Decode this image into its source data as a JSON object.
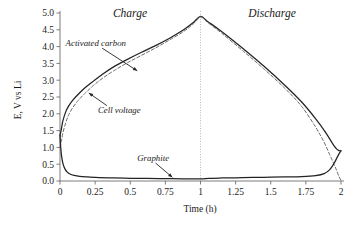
{
  "chart_data": {
    "type": "line",
    "title": "",
    "xlabel": "Time (h)",
    "ylabel": "E, V vs Li",
    "xlim": [
      0,
      2
    ],
    "ylim": [
      0.0,
      5.0
    ],
    "xticks": [
      "0",
      "0.25",
      "0.5",
      "0.75",
      "1",
      "1.25",
      "1.5",
      "1.75",
      "2"
    ],
    "xtick_values": [
      0,
      0.25,
      0.5,
      0.75,
      1,
      1.25,
      1.5,
      1.75,
      2
    ],
    "yticks": [
      "0.0",
      "0.5",
      "1.0",
      "1.5",
      "2.0",
      "2.5",
      "3.0",
      "3.5",
      "4.0",
      "4.5",
      "5.0"
    ],
    "ytick_values": [
      0.0,
      0.5,
      1.0,
      1.5,
      2.0,
      2.5,
      3.0,
      3.5,
      4.0,
      4.5,
      5.0
    ],
    "grid": false,
    "legend": "annotations",
    "regions": [
      {
        "name": "Charge",
        "label": "Charge",
        "x_start": 0,
        "x_end": 1
      },
      {
        "name": "Discharge",
        "label": "Discharge",
        "x_start": 1,
        "x_end": 2
      }
    ],
    "divider_x": 1,
    "series": [
      {
        "name": "Activated carbon",
        "style": "solid",
        "color": "#232323",
        "annotation": "Activated carbon",
        "x": [
          0.0,
          0.01,
          0.02,
          0.04,
          0.06,
          0.09,
          0.13,
          0.18,
          0.24,
          0.31,
          0.39,
          0.48,
          0.58,
          0.68,
          0.78,
          0.88,
          0.95,
          1.0,
          1.05,
          1.15,
          1.3,
          1.45,
          1.6,
          1.72,
          1.82,
          1.89,
          1.93,
          1.955,
          1.97,
          1.98,
          1.99,
          2.0
        ],
        "y": [
          1.35,
          1.55,
          1.78,
          2.05,
          2.22,
          2.4,
          2.58,
          2.78,
          2.98,
          3.2,
          3.42,
          3.62,
          3.83,
          4.03,
          4.25,
          4.5,
          4.72,
          4.9,
          4.75,
          4.45,
          3.95,
          3.42,
          2.85,
          2.35,
          1.85,
          1.45,
          1.18,
          1.02,
          0.95,
          0.92,
          0.9,
          0.9
        ]
      },
      {
        "name": "Cell voltage",
        "style": "dashed",
        "color": "#6a6a6a",
        "annotation": "Cell voltage",
        "x": [
          0.0,
          0.01,
          0.02,
          0.04,
          0.06,
          0.09,
          0.13,
          0.18,
          0.24,
          0.31,
          0.39,
          0.48,
          0.58,
          0.68,
          0.78,
          0.88,
          0.95,
          1.0,
          1.05,
          1.15,
          1.3,
          1.45,
          1.6,
          1.72,
          1.82,
          1.88,
          1.92,
          1.95,
          1.97,
          1.985,
          2.0
        ],
        "y": [
          1.0,
          1.18,
          1.42,
          1.72,
          1.95,
          2.18,
          2.4,
          2.62,
          2.85,
          3.08,
          3.3,
          3.52,
          3.74,
          3.96,
          4.2,
          4.45,
          4.68,
          4.88,
          4.72,
          4.4,
          3.88,
          3.34,
          2.76,
          2.22,
          1.6,
          1.15,
          0.78,
          0.5,
          0.3,
          0.14,
          0.02
        ]
      },
      {
        "name": "Graphite",
        "style": "solid",
        "color": "#232323",
        "annotation": "Graphite",
        "x": [
          0.0,
          0.005,
          0.012,
          0.022,
          0.035,
          0.05,
          0.07,
          0.1,
          0.14,
          0.2,
          0.28,
          0.38,
          0.5,
          0.62,
          0.75,
          0.88,
          1.0,
          1.06,
          1.15,
          1.3,
          1.45,
          1.6,
          1.72,
          1.82,
          1.88,
          1.92,
          1.95,
          1.97,
          1.985,
          2.0
        ],
        "y": [
          1.35,
          1.0,
          0.72,
          0.5,
          0.36,
          0.27,
          0.21,
          0.17,
          0.14,
          0.12,
          0.1,
          0.09,
          0.08,
          0.075,
          0.07,
          0.065,
          0.06,
          0.08,
          0.09,
          0.1,
          0.11,
          0.12,
          0.13,
          0.16,
          0.22,
          0.34,
          0.52,
          0.68,
          0.8,
          0.9
        ]
      }
    ],
    "annotations": [
      {
        "name": "activated-carbon",
        "text": "Activated carbon",
        "text_x": 0.04,
        "text_y": 4.02,
        "tip_x": 0.55,
        "tip_y": 3.28
      },
      {
        "name": "cell-voltage",
        "text": "Cell voltage",
        "text_x": 0.27,
        "text_y": 2.02,
        "tip_x": 0.205,
        "tip_y": 2.62
      },
      {
        "name": "graphite",
        "text": "Graphite",
        "text_x": 0.55,
        "text_y": 0.6,
        "tip_x": 0.8,
        "tip_y": 0.11
      }
    ]
  }
}
